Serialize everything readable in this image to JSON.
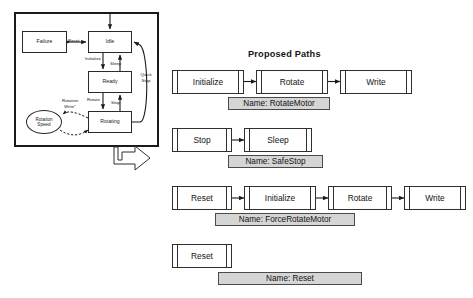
{
  "figure": {
    "state_machine": {
      "states": [
        {
          "id": "failure",
          "label": "Failure"
        },
        {
          "id": "idle",
          "label": "Idle"
        },
        {
          "id": "ready",
          "label": "Ready"
        },
        {
          "id": "rotating",
          "label": "Rotating"
        }
      ],
      "data_node": {
        "id": "rotation-speed",
        "line1": "Rotation",
        "line2": "Speed"
      },
      "transitions": [
        {
          "id": "reset",
          "label": "Reset",
          "from": "failure",
          "to": "idle"
        },
        {
          "id": "initialize",
          "label": "Initialize",
          "from": "idle",
          "to": "ready"
        },
        {
          "id": "sleep",
          "label": "Sleep",
          "from": "ready",
          "to": "idle"
        },
        {
          "id": "rotate",
          "label": "Rotate",
          "from": "ready",
          "to": "rotating"
        },
        {
          "id": "stop",
          "label": "Stop",
          "from": "rotating",
          "to": "ready"
        },
        {
          "id": "quick-stop",
          "label_line1": "Quick",
          "label_line2": "Stop",
          "from": "rotating",
          "to": "idle"
        },
        {
          "id": "rotation-write",
          "label_line1": "Rotation",
          "label_line2": "Write\"",
          "from": "rotating",
          "to": "rotation-speed"
        }
      ]
    },
    "paths_panel": {
      "title": "Proposed Paths",
      "paths": [
        {
          "id": "rotatemotor",
          "name_label": "Name: RotateMotor",
          "steps": [
            {
              "label": "Initialize"
            },
            {
              "label": "Rotate"
            },
            {
              "label": "Write"
            }
          ]
        },
        {
          "id": "safestop",
          "name_label": "Name: SafeStop",
          "steps": [
            {
              "label": "Stop"
            },
            {
              "label": "Sleep"
            }
          ]
        },
        {
          "id": "forcerotatemotor",
          "name_label": "Name: ForceRotateMotor",
          "steps": [
            {
              "label": "Reset"
            },
            {
              "label": "Initialize"
            },
            {
              "label": "Rotate"
            },
            {
              "label": "Write"
            }
          ]
        },
        {
          "id": "reset",
          "name_label": "Name: Reset",
          "steps": [
            {
              "label": "Reset"
            }
          ]
        }
      ]
    },
    "colors": {
      "stroke": "#2f2f2f",
      "frame": "#1a1a1a",
      "name_fill": "#d5d5d5",
      "node_fill": "#ffffff"
    }
  }
}
